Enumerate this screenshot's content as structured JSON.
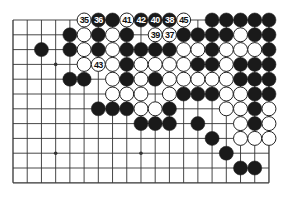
{
  "diagram": {
    "type": "go-board-fragment",
    "columns": 19,
    "rows": 12,
    "origin": {
      "x": 13,
      "y": 20
    },
    "spacing": {
      "x": 14.22,
      "y": 14.8
    },
    "stone_radius": 7,
    "colors": {
      "line": "#333333",
      "black": "#1a1a1a",
      "white": "#ffffff",
      "label_on_white": "#111111",
      "label_on_black": "#ffffff"
    },
    "star_points": [
      [
        3,
        3
      ],
      [
        3,
        9
      ],
      [
        9,
        9
      ]
    ],
    "stones": [
      {
        "c": 5,
        "r": 0,
        "color": "W",
        "label": "35"
      },
      {
        "c": 6,
        "r": 0,
        "color": "B",
        "label": "36"
      },
      {
        "c": 7,
        "r": 0,
        "color": "B"
      },
      {
        "c": 8,
        "r": 0,
        "color": "W",
        "label": "41"
      },
      {
        "c": 9,
        "r": 0,
        "color": "B",
        "label": "42"
      },
      {
        "c": 10,
        "r": 0,
        "color": "B",
        "label": "40"
      },
      {
        "c": 11,
        "r": 0,
        "color": "B",
        "label": "38"
      },
      {
        "c": 12,
        "r": 0,
        "color": "W",
        "label": "45"
      },
      {
        "c": 14,
        "r": 0,
        "color": "B"
      },
      {
        "c": 15,
        "r": 0,
        "color": "B"
      },
      {
        "c": 16,
        "r": 0,
        "color": "B"
      },
      {
        "c": 17,
        "r": 0,
        "color": "B"
      },
      {
        "c": 18,
        "r": 0,
        "color": "B"
      },
      {
        "c": 4,
        "r": 1,
        "color": "B"
      },
      {
        "c": 5,
        "r": 1,
        "color": "W"
      },
      {
        "c": 6,
        "r": 1,
        "color": "B"
      },
      {
        "c": 7,
        "r": 1,
        "color": "W"
      },
      {
        "c": 8,
        "r": 1,
        "color": "B"
      },
      {
        "c": 10,
        "r": 1,
        "color": "W",
        "label": "39"
      },
      {
        "c": 11,
        "r": 1,
        "color": "W",
        "label": "37"
      },
      {
        "c": 12,
        "r": 1,
        "color": "B"
      },
      {
        "c": 13,
        "r": 1,
        "color": "B"
      },
      {
        "c": 14,
        "r": 1,
        "color": "B"
      },
      {
        "c": 15,
        "r": 1,
        "color": "B"
      },
      {
        "c": 16,
        "r": 1,
        "color": "W"
      },
      {
        "c": 17,
        "r": 1,
        "color": "B"
      },
      {
        "c": 18,
        "r": 1,
        "color": "B"
      },
      {
        "c": 2,
        "r": 2,
        "color": "B"
      },
      {
        "c": 4,
        "r": 2,
        "color": "B"
      },
      {
        "c": 5,
        "r": 2,
        "color": "W"
      },
      {
        "c": 6,
        "r": 2,
        "color": "B"
      },
      {
        "c": 7,
        "r": 2,
        "color": "W"
      },
      {
        "c": 8,
        "r": 2,
        "color": "B"
      },
      {
        "c": 9,
        "r": 2,
        "color": "B"
      },
      {
        "c": 10,
        "r": 2,
        "color": "B"
      },
      {
        "c": 11,
        "r": 2,
        "color": "B"
      },
      {
        "c": 12,
        "r": 2,
        "color": "W"
      },
      {
        "c": 13,
        "r": 2,
        "color": "W"
      },
      {
        "c": 14,
        "r": 2,
        "color": "B"
      },
      {
        "c": 15,
        "r": 2,
        "color": "W"
      },
      {
        "c": 16,
        "r": 2,
        "color": "W"
      },
      {
        "c": 17,
        "r": 2,
        "color": "W"
      },
      {
        "c": 18,
        "r": 2,
        "color": "B"
      },
      {
        "c": 5,
        "r": 3,
        "color": "W"
      },
      {
        "c": 6,
        "r": 3,
        "color": "W",
        "label": "43"
      },
      {
        "c": 7,
        "r": 3,
        "color": "W"
      },
      {
        "c": 8,
        "r": 3,
        "color": "B"
      },
      {
        "c": 9,
        "r": 3,
        "color": "W"
      },
      {
        "c": 10,
        "r": 3,
        "color": "W"
      },
      {
        "c": 11,
        "r": 3,
        "color": "W"
      },
      {
        "c": 12,
        "r": 3,
        "color": "W"
      },
      {
        "c": 13,
        "r": 3,
        "color": "B"
      },
      {
        "c": 14,
        "r": 3,
        "color": "B"
      },
      {
        "c": 15,
        "r": 3,
        "color": "W"
      },
      {
        "c": 16,
        "r": 3,
        "color": "B"
      },
      {
        "c": 17,
        "r": 3,
        "color": "B"
      },
      {
        "c": 18,
        "r": 3,
        "color": "B"
      },
      {
        "c": 4,
        "r": 4,
        "color": "B"
      },
      {
        "c": 5,
        "r": 4,
        "color": "B"
      },
      {
        "c": 7,
        "r": 4,
        "color": "W"
      },
      {
        "c": 8,
        "r": 4,
        "color": "B"
      },
      {
        "c": 9,
        "r": 4,
        "color": "W"
      },
      {
        "c": 10,
        "r": 4,
        "color": "B"
      },
      {
        "c": 11,
        "r": 4,
        "color": "W"
      },
      {
        "c": 12,
        "r": 4,
        "color": "W"
      },
      {
        "c": 13,
        "r": 4,
        "color": "W"
      },
      {
        "c": 14,
        "r": 4,
        "color": "W"
      },
      {
        "c": 15,
        "r": 4,
        "color": "W"
      },
      {
        "c": 16,
        "r": 4,
        "color": "B"
      },
      {
        "c": 17,
        "r": 4,
        "color": "B"
      },
      {
        "c": 18,
        "r": 4,
        "color": "B"
      },
      {
        "c": 7,
        "r": 5,
        "color": "W"
      },
      {
        "c": 8,
        "r": 5,
        "color": "W"
      },
      {
        "c": 9,
        "r": 5,
        "color": "W"
      },
      {
        "c": 11,
        "r": 5,
        "color": "W"
      },
      {
        "c": 12,
        "r": 5,
        "color": "B"
      },
      {
        "c": 13,
        "r": 5,
        "color": "B"
      },
      {
        "c": 14,
        "r": 5,
        "color": "B"
      },
      {
        "c": 15,
        "r": 5,
        "color": "W"
      },
      {
        "c": 16,
        "r": 5,
        "color": "W"
      },
      {
        "c": 17,
        "r": 5,
        "color": "B"
      },
      {
        "c": 18,
        "r": 5,
        "color": "B"
      },
      {
        "c": 6,
        "r": 6,
        "color": "B"
      },
      {
        "c": 7,
        "r": 6,
        "color": "B"
      },
      {
        "c": 8,
        "r": 6,
        "color": "B"
      },
      {
        "c": 9,
        "r": 6,
        "color": "W"
      },
      {
        "c": 10,
        "r": 6,
        "color": "W"
      },
      {
        "c": 11,
        "r": 6,
        "color": "B"
      },
      {
        "c": 15,
        "r": 6,
        "color": "W"
      },
      {
        "c": 16,
        "r": 6,
        "color": "W"
      },
      {
        "c": 17,
        "r": 6,
        "color": "B"
      },
      {
        "c": 18,
        "r": 6,
        "color": "W"
      },
      {
        "c": 9,
        "r": 7,
        "color": "B"
      },
      {
        "c": 10,
        "r": 7,
        "color": "B"
      },
      {
        "c": 11,
        "r": 7,
        "color": "B"
      },
      {
        "c": 13,
        "r": 7,
        "color": "B"
      },
      {
        "c": 16,
        "r": 7,
        "color": "W"
      },
      {
        "c": 17,
        "r": 7,
        "color": "B"
      },
      {
        "c": 18,
        "r": 7,
        "color": "W"
      },
      {
        "c": 14,
        "r": 8,
        "color": "B"
      },
      {
        "c": 16,
        "r": 8,
        "color": "W"
      },
      {
        "c": 17,
        "r": 8,
        "color": "W"
      },
      {
        "c": 18,
        "r": 8,
        "color": "W"
      },
      {
        "c": 15,
        "r": 9,
        "color": "B"
      },
      {
        "c": 16,
        "r": 10,
        "color": "B"
      },
      {
        "c": 17,
        "r": 10,
        "color": "B"
      }
    ]
  }
}
